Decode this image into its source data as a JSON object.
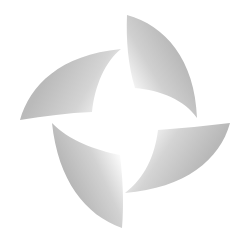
{
  "logo": {
    "name": "pinwheel-logo",
    "blades": 4,
    "colors": {
      "background": "#ffffff",
      "blade_dark": "#b4b4b4",
      "blade_mid": "#d2d2d2",
      "blade_light": "#ffffff"
    }
  }
}
